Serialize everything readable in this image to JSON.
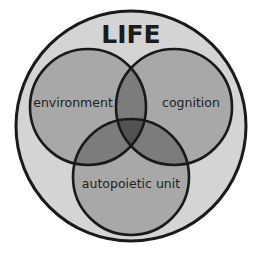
{
  "diagram": {
    "type": "venn",
    "title": "LIFE",
    "sets": [
      {
        "id": "environment",
        "label": "environment"
      },
      {
        "id": "cognition",
        "label": "cognition"
      },
      {
        "id": "autopoietic_unit",
        "label": "autopoietic unit"
      }
    ],
    "container_label": "LIFE",
    "colors": {
      "outer_fill": "#d4d4d4",
      "circle_fill": "#a8a8a8",
      "pair_overlap": "#7c7c7c",
      "triple_overlap": "#525252",
      "stroke": "#1a1a1a",
      "text": "#222222"
    }
  }
}
